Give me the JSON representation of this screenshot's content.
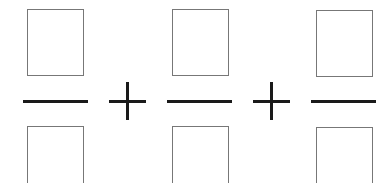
{
  "expression": {
    "fractions": [
      {
        "numerator": "",
        "denominator": ""
      },
      {
        "numerator": "",
        "denominator": ""
      },
      {
        "numerator": "",
        "denominator": ""
      }
    ],
    "operators": [
      "+",
      "+"
    ]
  }
}
